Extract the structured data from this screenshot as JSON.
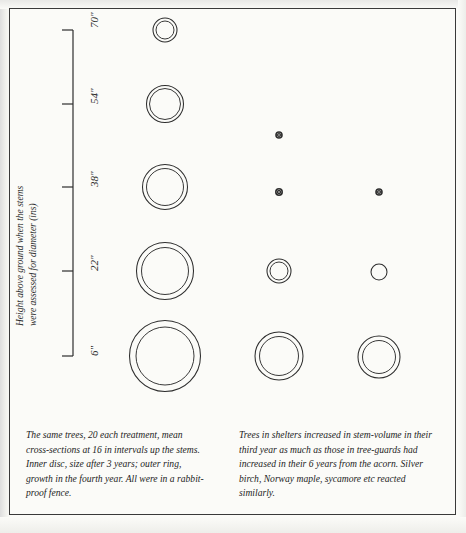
{
  "figure": {
    "y_axis": {
      "label_line1": "Height above ground when the stems",
      "label_line2": "were assessed for diameter (ins)",
      "ticks": [
        "70\"",
        "54\"",
        "38\"",
        "22\"",
        "6\""
      ]
    },
    "captions": {
      "left": "The same trees, 20 each treatment, mean cross-sections at 16 in intervals up the stems. Inner disc, size after 3 years; outer ring, growth in the fourth year. All were in a rabbit-proof fence.",
      "right": "Trees in shelters increased in stem-volume in their third year as much as those in tree-guards had increased in their 6 years from the acorn. Silver birch, Norway maple, sycamore etc reacted similarly."
    },
    "stroke_color": "#2e2e2e",
    "frame_color": "#3a3a3a",
    "paper_color": "#fbfbf8"
  },
  "chart_data": {
    "type": "scatter",
    "title": "",
    "xlabel": "",
    "ylabel": "Height above ground when the stems were assessed for diameter (ins)",
    "y_tick_values": [
      70,
      54,
      38,
      22,
      6
    ],
    "y_tick_labels": [
      "70\"",
      "54\"",
      "38\"",
      "22\"",
      "6\""
    ],
    "ylim": [
      2,
      74
    ],
    "grid": false,
    "legend": null,
    "series": [
      {
        "name": "column-1-tree-shelters",
        "column_x": 165,
        "points": [
          {
            "height_in": 70,
            "outer_radius_px": 12.0,
            "inner_radius_px": 9.0,
            "cy": 30
          },
          {
            "height_in": 54,
            "outer_radius_px": 18.5,
            "inner_radius_px": 15.5,
            "cy": 104
          },
          {
            "height_in": 38,
            "outer_radius_px": 22.5,
            "inner_radius_px": 18.5,
            "cy": 187
          },
          {
            "height_in": 22,
            "outer_radius_px": 28.5,
            "inner_radius_px": 23.5,
            "cy": 271
          },
          {
            "height_in": 6,
            "outer_radius_px": 35.5,
            "inner_radius_px": 29.0,
            "cy": 356
          }
        ]
      },
      {
        "name": "column-2-tree-guards",
        "column_x": 279,
        "points": [
          {
            "height_in": 54,
            "outer_radius_px": 3.0,
            "inner_radius_px": 1.4,
            "cy": 135
          },
          {
            "height_in": 38,
            "outer_radius_px": 3.2,
            "inner_radius_px": 1.5,
            "cy": 192
          },
          {
            "height_in": 22,
            "outer_radius_px": 12.0,
            "inner_radius_px": 9.0,
            "cy": 271
          },
          {
            "height_in": 6,
            "outer_radius_px": 24.0,
            "inner_radius_px": 19.5,
            "cy": 356
          }
        ]
      },
      {
        "name": "column-3-unprotected",
        "column_x": 379,
        "points": [
          {
            "height_in": 38,
            "outer_radius_px": 3.0,
            "inner_radius_px": 1.4,
            "cy": 192
          },
          {
            "height_in": 22,
            "outer_radius_px": 8.0,
            "inner_radius_px": 8.0,
            "cy": 272
          },
          {
            "height_in": 6,
            "outer_radius_px": 21.0,
            "inner_radius_px": 16.5,
            "cy": 357
          }
        ]
      }
    ]
  }
}
